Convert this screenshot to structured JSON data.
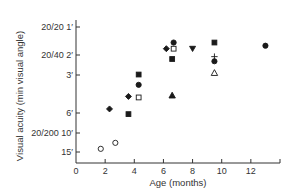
{
  "chart_data": {
    "type": "scatter",
    "title": "",
    "xlabel": "Age (months)",
    "ylabel": "Visual acuity (min visual angle)",
    "xlim": [
      0,
      14
    ],
    "ylim_minutes": [
      1,
      15
    ],
    "y_scale": "log",
    "y_inverted": true,
    "grid": false,
    "legend": "none",
    "x_ticks": [
      0,
      2,
      4,
      6,
      8,
      10,
      12
    ],
    "y_ticks": [
      {
        "value": 1,
        "label": "20/20 1′"
      },
      {
        "value": 2,
        "label": "20/40 2′"
      },
      {
        "value": 3,
        "label": "3′"
      },
      {
        "value": 6,
        "label": "6′"
      },
      {
        "value": 10,
        "label": "20/200 10′"
      },
      {
        "value": 15,
        "label": "15′"
      }
    ],
    "series": [
      {
        "name": "filled-diamond",
        "marker": "diamond",
        "filled": true,
        "points": [
          [
            2.3,
            5.9
          ],
          [
            3.6,
            4.5
          ],
          [
            6.2,
            1.6
          ]
        ]
      },
      {
        "name": "open-circle",
        "marker": "circle",
        "filled": false,
        "points": [
          [
            1.7,
            14.0
          ],
          [
            2.7,
            12.3
          ]
        ]
      },
      {
        "name": "filled-square",
        "marker": "square",
        "filled": true,
        "points": [
          [
            3.6,
            6.6
          ],
          [
            4.3,
            2.8
          ],
          [
            6.6,
            2.0
          ],
          [
            9.5,
            1.4
          ]
        ]
      },
      {
        "name": "filled-circle",
        "marker": "circle",
        "filled": true,
        "points": [
          [
            4.3,
            3.5
          ],
          [
            6.7,
            1.4
          ],
          [
            9.5,
            2.1
          ],
          [
            13.0,
            1.5
          ]
        ]
      },
      {
        "name": "open-square",
        "marker": "square",
        "filled": false,
        "points": [
          [
            4.3,
            4.6
          ],
          [
            6.7,
            1.6
          ]
        ]
      },
      {
        "name": "filled-triangle",
        "marker": "triangle-up",
        "filled": true,
        "points": [
          [
            6.6,
            4.4
          ]
        ]
      },
      {
        "name": "filled-down-triangle",
        "marker": "triangle-down",
        "filled": true,
        "points": [
          [
            8.0,
            1.6
          ]
        ]
      },
      {
        "name": "plus",
        "marker": "plus",
        "filled": false,
        "points": [
          [
            9.5,
            1.9
          ]
        ]
      },
      {
        "name": "open-triangle",
        "marker": "triangle-up",
        "filled": false,
        "points": [
          [
            9.5,
            2.7
          ]
        ]
      }
    ]
  },
  "colors": {
    "axis": "#333333",
    "marker": "#1a1a1a",
    "background": "#ffffff"
  }
}
